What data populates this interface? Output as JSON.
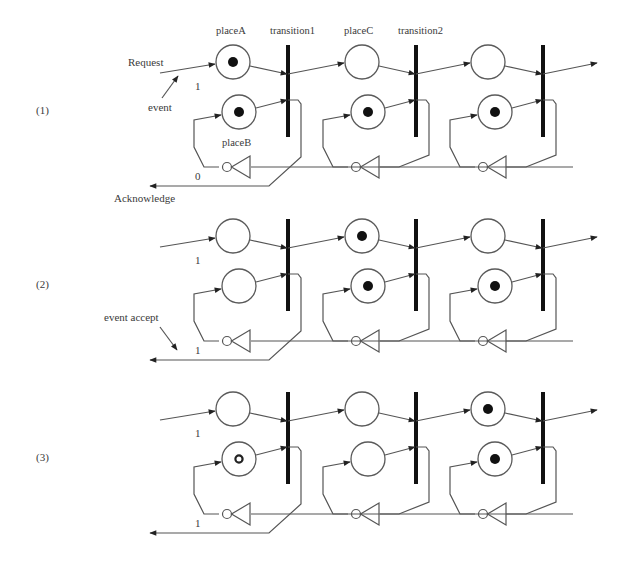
{
  "figure": {
    "type": "petri-net-diagram",
    "stages": [
      {
        "label": "(1)",
        "input_value": "1",
        "ack_value": "0",
        "tokens": {
          "upper": [
            true,
            false,
            false
          ],
          "lower": [
            true,
            true,
            true
          ]
        },
        "hollow_lower": [
          false,
          false,
          false
        ]
      },
      {
        "label": "(2)",
        "input_value": "1",
        "ack_value": "1",
        "tokens": {
          "upper": [
            false,
            true,
            false
          ],
          "lower": [
            false,
            true,
            true
          ]
        },
        "hollow_lower": [
          false,
          false,
          false
        ]
      },
      {
        "label": "(3)",
        "input_value": "1",
        "ack_value": "1",
        "tokens": {
          "upper": [
            false,
            false,
            true
          ],
          "lower": [
            false,
            false,
            true
          ]
        },
        "hollow_lower": [
          true,
          false,
          false
        ]
      }
    ],
    "labels": {
      "placeA": "placeA",
      "placeB": "placeB",
      "placeC": "placeC",
      "transition1": "transition1",
      "transition2": "transition2",
      "request": "Request",
      "event": "event",
      "acknowledge": "Acknowledge",
      "event_accept": "event accept"
    },
    "colors": {
      "background": "#ffffff",
      "line": "#555555",
      "transition": "#111111",
      "token": "#111111",
      "text": "#3a3a3a"
    }
  }
}
